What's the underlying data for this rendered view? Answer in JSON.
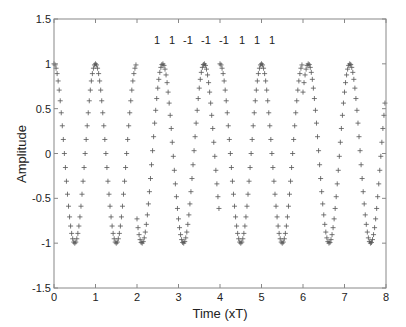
{
  "chart_data": {
    "type": "scatter",
    "title": "",
    "xlabel": "Time (xT)",
    "ylabel": "Amplitude",
    "xlim": [
      0,
      8
    ],
    "ylim": [
      -1.5,
      1.5
    ],
    "xticks": [
      "0",
      "1",
      "2",
      "3",
      "4",
      "5",
      "6",
      "7",
      "8"
    ],
    "yticks": [
      "1.5",
      "1",
      "0.5",
      "0",
      "-0.5",
      "-1",
      "-1.5"
    ],
    "annotation_bits": [
      "1",
      "1",
      "-1",
      "-1",
      "-1",
      "1",
      "1",
      "1"
    ],
    "marker": "+",
    "marker_color": "#555555",
    "series": [
      {
        "name": "segment-1",
        "t_start": 0,
        "t_end": 2,
        "phase_offset": 0
      },
      {
        "name": "segment-2",
        "t_start": 2,
        "t_end": 4,
        "phase_offset": 2.62
      },
      {
        "name": "segment-3",
        "t_start": 4,
        "t_end": 6,
        "phase_offset": 0
      },
      {
        "name": "segment-4",
        "t_start": 6,
        "t_end": 8,
        "phase_offset": 6.13
      }
    ],
    "function": "cos(2*pi*(t - phase_offset))",
    "samples_per_unit": 40,
    "grid": false,
    "legend": "none"
  }
}
